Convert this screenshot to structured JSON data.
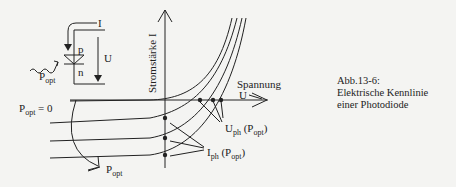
{
  "circuit": {
    "current_label": "I",
    "p_label": "p",
    "n_label": "n",
    "voltage_label": "U",
    "light_label": "P",
    "light_sub": "opt"
  },
  "axes": {
    "y_label": "Stromstärke I",
    "x_label_line1": "Spannung",
    "x_label_line2": "U"
  },
  "annotations": {
    "popt_zero": "P",
    "popt_zero_sub": "opt",
    "popt_zero_suffix": " = 0",
    "popt_arrow": "P",
    "popt_arrow_sub": "opt",
    "uph": "U",
    "uph_sub": "ph",
    "uph_arg": " (P",
    "uph_arg_sub": "opt",
    "uph_close": ")",
    "iph": "I",
    "iph_sub": "ph",
    "iph_arg": " (P",
    "iph_arg_sub": "opt",
    "iph_close": ")"
  },
  "caption": {
    "line1": "Abb.13-6:",
    "line2": "Elektrische Kennlinie",
    "line3": "einer Photodiode"
  },
  "colors": {
    "ink": "#222222",
    "background": "#f4f4f2"
  }
}
